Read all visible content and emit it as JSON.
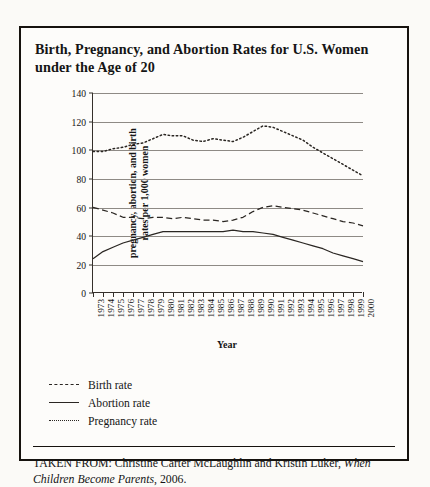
{
  "figure": {
    "title": "Birth, Pregnancy, and Abortion Rates for U.S. Women under the Age of 20",
    "source_prefix": "TAKEN FROM: Christine Carter McLaughlin and Kristin Luker, ",
    "source_italic": "When Children Become Parents",
    "source_suffix": ", 2006."
  },
  "legend": {
    "items": [
      {
        "label": "Birth rate",
        "style": "dashed"
      },
      {
        "label": "Abortion rate",
        "style": "solid"
      },
      {
        "label": "Pregnancy rate",
        "style": "dotted"
      }
    ]
  },
  "chart_data": {
    "type": "line",
    "title": "Birth, Pregnancy, and Abortion Rates for U.S. Women under the Age of 20",
    "xlabel": "Year",
    "ylabel": "pregnancy, abortion, and birth rates per 1,000 women",
    "ylim": [
      0,
      140
    ],
    "yticks": [
      0,
      20,
      40,
      60,
      80,
      100,
      120,
      140
    ],
    "grid": true,
    "legend_position": "below-plot-left",
    "x": [
      1973,
      1974,
      1975,
      1976,
      1977,
      1978,
      1979,
      1980,
      1981,
      1982,
      1983,
      1984,
      1985,
      1986,
      1987,
      1988,
      1989,
      1990,
      1991,
      1992,
      1993,
      1994,
      1995,
      1996,
      1997,
      1998,
      1999,
      2000
    ],
    "series": [
      {
        "name": "Pregnancy rate",
        "style": "dotted",
        "values": [
          99,
          99,
          101,
          102,
          104,
          105,
          108,
          111,
          110,
          110,
          107,
          106,
          108,
          107,
          106,
          109,
          113,
          117,
          116,
          113,
          110,
          107,
          102,
          98,
          94,
          90,
          86,
          82
        ]
      },
      {
        "name": "Birth rate",
        "style": "dashed",
        "values": [
          60,
          58,
          56,
          53,
          53,
          52,
          53,
          53,
          52,
          53,
          52,
          51,
          51,
          50,
          51,
          53,
          57,
          60,
          61,
          60,
          59,
          58,
          56,
          54,
          52,
          50,
          49,
          47
        ]
      },
      {
        "name": "Abortion rate",
        "style": "solid",
        "values": [
          24,
          29,
          32,
          35,
          37,
          39,
          41,
          43,
          43,
          43,
          43,
          43,
          43,
          43,
          44,
          43,
          43,
          42,
          41,
          39,
          37,
          35,
          33,
          31,
          28,
          26,
          24,
          22
        ]
      }
    ]
  }
}
